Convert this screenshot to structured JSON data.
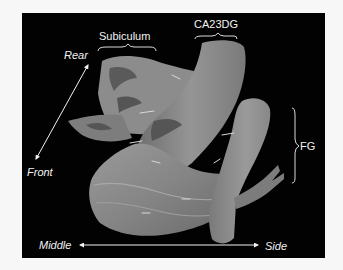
{
  "figure": {
    "background_color": "#020202",
    "surface_color": "#8a8a8a",
    "label_color": "#f2f2f2",
    "structure_labels": {
      "subiculum": "Subiculum",
      "ca23dg": "CA23DG",
      "fg": "FG"
    },
    "orientation_labels": {
      "rear": "Rear",
      "front": "Front",
      "middle": "Middle",
      "side": "Side"
    }
  }
}
